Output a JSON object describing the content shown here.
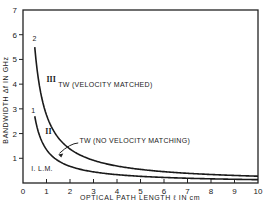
{
  "chart_data": {
    "type": "line",
    "title": "",
    "xlabel": "OPTICAL PATH LENGTH ℓ IN cm",
    "ylabel": "BANDWIDTH Δf IN GHz",
    "xlim": [
      0,
      10
    ],
    "ylim": [
      0,
      7
    ],
    "xticks": [
      0,
      1,
      2,
      3,
      4,
      5,
      6,
      7,
      8,
      9,
      10
    ],
    "yticks": [
      0,
      1,
      2,
      3,
      4,
      5,
      6,
      7
    ],
    "grid": false,
    "legend": null,
    "series": [
      {
        "name": "Curve 2 (TW velocity matched)",
        "label": "2",
        "x": [
          0.5,
          0.75,
          1,
          1.5,
          2,
          2.5,
          3,
          4,
          5,
          6,
          7,
          8,
          9,
          10
        ],
        "values": [
          5.5,
          3.67,
          2.75,
          1.83,
          1.38,
          1.1,
          0.92,
          0.69,
          0.55,
          0.46,
          0.39,
          0.34,
          0.31,
          0.28
        ]
      },
      {
        "name": "Curve 1 (TW no velocity matching)",
        "label": "1",
        "x": [
          0.5,
          0.75,
          1,
          1.5,
          2,
          2.5,
          3,
          4,
          5,
          6,
          7,
          8,
          9,
          10
        ],
        "values": [
          2.7,
          1.8,
          1.35,
          0.9,
          0.68,
          0.54,
          0.45,
          0.34,
          0.27,
          0.23,
          0.19,
          0.17,
          0.15,
          0.14
        ]
      }
    ],
    "annotations": [
      {
        "text": "TW (VELOCITY MATCHED)",
        "x": 1.5,
        "y": 3.9
      },
      {
        "text": "TW (NO VELOCITY MATCHING)",
        "x": 2.4,
        "y": 1.6
      },
      {
        "text": "III",
        "x": 1.0,
        "y": 4.1
      },
      {
        "text": "II",
        "x": 0.95,
        "y": 2.0
      },
      {
        "text": "I. L.M.",
        "x": 0.35,
        "y": 0.5
      },
      {
        "text": "2",
        "x": 0.4,
        "y": 5.75
      },
      {
        "text": "1",
        "x": 0.35,
        "y": 2.85
      }
    ]
  }
}
